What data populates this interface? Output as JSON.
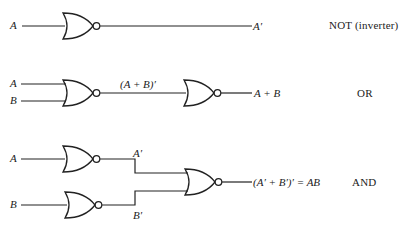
{
  "diagram": {
    "rows": [
      {
        "name": "NOT (inverter)",
        "inputs": [
          "A"
        ],
        "output": "A′",
        "gates": [
          "NOR"
        ]
      },
      {
        "name": "OR",
        "inputs": [
          "A",
          "B"
        ],
        "intermediate": "(A + B)′",
        "output": "A + B",
        "gates": [
          "NOR",
          "NOR"
        ]
      },
      {
        "name": "AND",
        "inputs": [
          "A",
          "B"
        ],
        "intermediates": [
          "A′",
          "B′"
        ],
        "output": "(A′ + B′)′ = AB",
        "gates": [
          "NOR",
          "NOR",
          "NOR"
        ]
      }
    ]
  },
  "labels": {
    "not_in_a": "A",
    "not_out": "A′",
    "not_name": "NOT (inverter)",
    "or_in_a": "A",
    "or_in_b": "B",
    "or_mid": "(A + B)′",
    "or_out": "A + B",
    "or_name": "OR",
    "and_in_a": "A",
    "and_in_b": "B",
    "and_mid_a": "A′",
    "and_mid_b": "B′",
    "and_out": "(A′ + B′)′ = AB",
    "and_name": "AND"
  },
  "colors": {
    "stroke": "#222222",
    "background": "#ffffff"
  }
}
